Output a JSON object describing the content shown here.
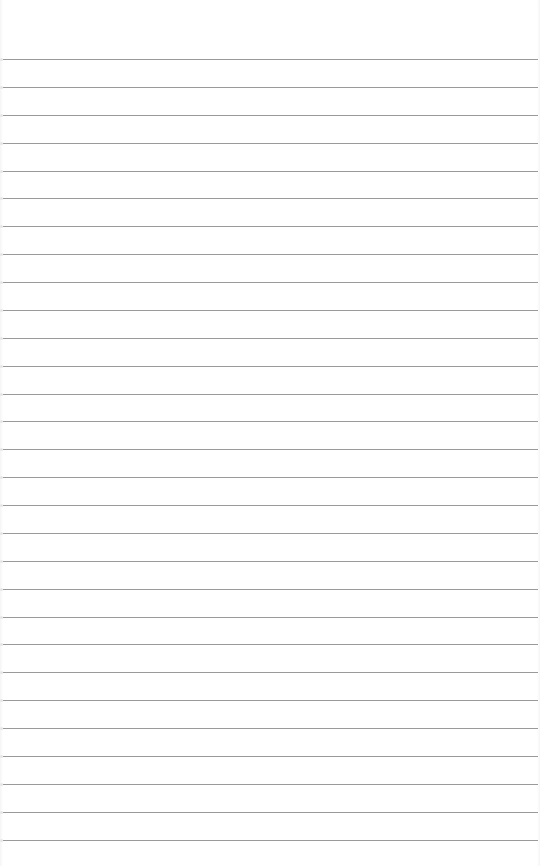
{
  "page": {
    "type": "ruled-paper",
    "background_color": "#ffffff",
    "line_color": "#9a9a9a",
    "line_count": 29,
    "first_line_y": 59.5,
    "line_spacing": 27.875,
    "line_left": 3,
    "line_right": 538
  }
}
